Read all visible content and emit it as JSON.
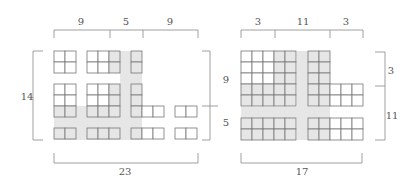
{
  "colors": {
    "grid_line": "#777777",
    "cell_fill": "#ffffff",
    "shade": "#e6e6e6",
    "bracket": "#888888",
    "label": "#555555"
  },
  "cell_size": 11,
  "left_diagram": {
    "top_labels": [
      "9",
      "5",
      "9"
    ],
    "left_label": "14",
    "right_labels": [
      "9",
      "5"
    ],
    "bottom_label": "23",
    "grids": [
      {
        "x": 54,
        "y": 51,
        "cols": 2,
        "rows": 2,
        "shaded_cells": []
      },
      {
        "x": 87,
        "y": 51,
        "cols": 3,
        "rows": 2,
        "shaded_cells": [
          [
            0,
            2
          ],
          [
            1,
            2
          ]
        ]
      },
      {
        "x": 131,
        "y": 51,
        "cols": 1,
        "rows": 2,
        "shaded_cells": [
          [
            0,
            0
          ],
          [
            1,
            0
          ]
        ]
      },
      {
        "x": 54,
        "y": 84,
        "cols": 2,
        "rows": 3,
        "shaded_cells": [
          [
            2,
            0
          ],
          [
            2,
            1
          ]
        ]
      },
      {
        "x": 87,
        "y": 84,
        "cols": 3,
        "rows": 3,
        "shaded_cells": [
          [
            0,
            2
          ],
          [
            1,
            2
          ],
          [
            2,
            0
          ],
          [
            2,
            1
          ],
          [
            2,
            2
          ]
        ]
      },
      {
        "x": 131,
        "y": 84,
        "cols": 1,
        "rows": 3,
        "shaded_cells": [
          [
            0,
            0
          ],
          [
            1,
            0
          ],
          [
            2,
            0
          ]
        ]
      },
      {
        "x": 142,
        "y": 106,
        "cols": 2,
        "rows": 1,
        "shaded_cells": []
      },
      {
        "x": 175,
        "y": 106,
        "cols": 2,
        "rows": 1,
        "shaded_cells": []
      },
      {
        "x": 54,
        "y": 128,
        "cols": 2,
        "rows": 1,
        "shaded_cells": [
          [
            0,
            0
          ],
          [
            0,
            1
          ]
        ]
      },
      {
        "x": 87,
        "y": 128,
        "cols": 3,
        "rows": 1,
        "shaded_cells": [
          [
            0,
            0
          ],
          [
            0,
            1
          ],
          [
            0,
            2
          ]
        ]
      },
      {
        "x": 131,
        "y": 128,
        "cols": 1,
        "rows": 1,
        "shaded_cells": [
          [
            0,
            0
          ]
        ]
      },
      {
        "x": 142,
        "y": 128,
        "cols": 2,
        "rows": 1,
        "shaded_cells": []
      },
      {
        "x": 175,
        "y": 128,
        "cols": 2,
        "rows": 1,
        "shaded_cells": []
      }
    ],
    "shade_bands": [
      {
        "x": 120,
        "y": 51,
        "w": 22,
        "h": 89
      },
      {
        "x": 54,
        "y": 106,
        "w": 88,
        "h": 34
      }
    ]
  },
  "right_diagram": {
    "top_labels": [
      "3",
      "11",
      "3"
    ],
    "right_labels": [
      "3",
      "11"
    ],
    "bottom_label": "17",
    "grids": [
      {
        "x": 241,
        "y": 51,
        "cols": 5,
        "rows": 5,
        "shaded_cells": [
          [
            0,
            3
          ],
          [
            0,
            4
          ],
          [
            1,
            3
          ],
          [
            1,
            4
          ],
          [
            2,
            3
          ],
          [
            2,
            4
          ],
          [
            3,
            0
          ],
          [
            3,
            1
          ],
          [
            3,
            2
          ],
          [
            3,
            3
          ],
          [
            3,
            4
          ],
          [
            4,
            0
          ],
          [
            4,
            1
          ],
          [
            4,
            2
          ],
          [
            4,
            3
          ],
          [
            4,
            4
          ]
        ]
      },
      {
        "x": 308,
        "y": 51,
        "cols": 2,
        "rows": 5,
        "shaded_cells": [
          [
            0,
            0
          ],
          [
            0,
            1
          ],
          [
            1,
            0
          ],
          [
            1,
            1
          ],
          [
            2,
            0
          ],
          [
            2,
            1
          ],
          [
            3,
            0
          ],
          [
            3,
            1
          ],
          [
            4,
            0
          ],
          [
            4,
            1
          ]
        ]
      },
      {
        "x": 330,
        "y": 84,
        "cols": 3,
        "rows": 2,
        "shaded_cells": []
      },
      {
        "x": 241,
        "y": 118,
        "cols": 5,
        "rows": 2,
        "shaded_cells": [
          [
            0,
            0
          ],
          [
            0,
            1
          ],
          [
            0,
            2
          ],
          [
            0,
            3
          ],
          [
            0,
            4
          ],
          [
            1,
            0
          ],
          [
            1,
            1
          ],
          [
            1,
            2
          ],
          [
            1,
            3
          ],
          [
            1,
            4
          ]
        ]
      },
      {
        "x": 308,
        "y": 118,
        "cols": 5,
        "rows": 2,
        "shaded_cells": [
          [
            0,
            0
          ],
          [
            0,
            1
          ],
          [
            1,
            0
          ],
          [
            1,
            1
          ]
        ]
      }
    ],
    "shade_bands": [
      {
        "x": 297,
        "y": 51,
        "w": 11,
        "h": 89
      },
      {
        "x": 241,
        "y": 107,
        "w": 89,
        "h": 11
      }
    ]
  }
}
